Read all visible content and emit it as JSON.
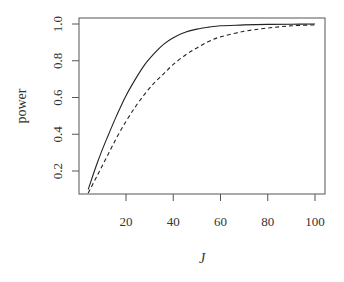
{
  "chart_data": {
    "type": "line",
    "title": "",
    "xlabel": "J",
    "ylabel": "power",
    "xlim": [
      4,
      100
    ],
    "ylim": [
      0.08,
      1.02
    ],
    "xticks": [
      20,
      40,
      60,
      80,
      100
    ],
    "yticks": [
      0.2,
      0.4,
      0.6,
      0.8,
      1.0
    ],
    "ytick_labels": [
      "0.2",
      "0.4",
      "0.6",
      "0.8",
      "1.0"
    ],
    "xtick_labels": [
      "20",
      "40",
      "60",
      "80",
      "100"
    ],
    "grid": false,
    "legend": null,
    "x": [
      4,
      8,
      12,
      16,
      20,
      24,
      28,
      32,
      36,
      40,
      45,
      50,
      55,
      60,
      70,
      80,
      90,
      100
    ],
    "series": [
      {
        "name": "solid",
        "style": "solid",
        "values": [
          0.1,
          0.25,
          0.38,
          0.5,
          0.61,
          0.7,
          0.78,
          0.84,
          0.89,
          0.925,
          0.955,
          0.972,
          0.983,
          0.99,
          0.995,
          0.998,
          0.999,
          1.0
        ]
      },
      {
        "name": "dashed",
        "style": "dashed",
        "values": [
          0.08,
          0.18,
          0.28,
          0.38,
          0.47,
          0.55,
          0.62,
          0.68,
          0.73,
          0.78,
          0.83,
          0.87,
          0.905,
          0.93,
          0.96,
          0.978,
          0.99,
          0.995
        ]
      }
    ]
  }
}
